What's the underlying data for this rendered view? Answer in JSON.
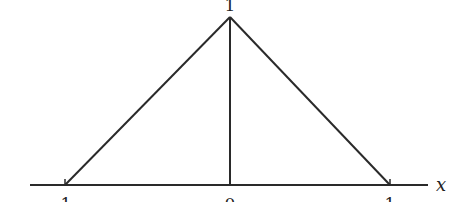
{
  "diagram": {
    "type": "triangular-function-plot",
    "axis_label": "x",
    "peak_label": "1",
    "tick_labels": {
      "left": "1",
      "center": "0",
      "right": "1"
    },
    "colors": {
      "line": "#2a2a2a",
      "background": "#ffffff"
    }
  }
}
